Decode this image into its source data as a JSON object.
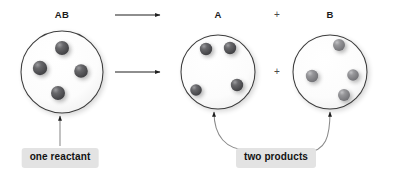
{
  "diagram": {
    "background_color": "#ffffff",
    "sphere_color_dark": "#4f4f52",
    "sphere_color_mid": "#6d6d70",
    "sphere_color_light": "#8f8f92",
    "outline_color": "#3c3c3c",
    "callout_bg_color": "#e3e3e3",
    "callout_text_color": "#121212",
    "leader_color": "#8a8a8a"
  },
  "formulas": {
    "reactant": "AB",
    "product_a": "A",
    "product_b": "B",
    "plus_top": "+",
    "plus_middle": "+"
  },
  "callouts": {
    "reactant_label": "one reactant",
    "products_label": "two products"
  },
  "containers": [
    {
      "id": "reactant-flask",
      "label": "AB",
      "cx": 62,
      "cy": 72,
      "r": 41,
      "molecule_count": 4,
      "molecules": [
        {
          "cx": 62,
          "cy": 48,
          "r": 7.0,
          "shade": "dark"
        },
        {
          "cx": 40,
          "cy": 68,
          "r": 7.2,
          "shade": "dark"
        },
        {
          "cx": 81,
          "cy": 71,
          "r": 6.8,
          "shade": "dark"
        },
        {
          "cx": 58,
          "cy": 93,
          "r": 7.0,
          "shade": "dark"
        }
      ]
    },
    {
      "id": "product-a-flask",
      "label": "A",
      "cx": 218,
      "cy": 72,
      "r": 37,
      "molecule_count": 4,
      "molecules": [
        {
          "cx": 206,
          "cy": 49,
          "r": 6.2,
          "shade": "dark"
        },
        {
          "cx": 230,
          "cy": 48,
          "r": 6.2,
          "shade": "dark"
        },
        {
          "cx": 196,
          "cy": 90,
          "r": 5.8,
          "shade": "dark"
        },
        {
          "cx": 237,
          "cy": 85,
          "r": 6.2,
          "shade": "dark"
        }
      ]
    },
    {
      "id": "product-b-flask",
      "label": "B",
      "cx": 330,
      "cy": 72,
      "r": 37,
      "molecule_count": 4,
      "molecules": [
        {
          "cx": 339,
          "cy": 45,
          "r": 6.0,
          "shade": "light"
        },
        {
          "cx": 312,
          "cy": 76,
          "r": 6.2,
          "shade": "light"
        },
        {
          "cx": 353,
          "cy": 75,
          "r": 5.8,
          "shade": "light"
        },
        {
          "cx": 344,
          "cy": 95,
          "r": 6.0,
          "shade": "light"
        }
      ]
    }
  ],
  "arrows": [
    {
      "id": "arrow-top",
      "x1": 115,
      "y1": 15,
      "x2": 163,
      "y2": 15
    },
    {
      "id": "arrow-bottom",
      "x1": 115,
      "y1": 72,
      "x2": 163,
      "y2": 72
    }
  ],
  "label_positions": {
    "reactant_formula": {
      "x": 62,
      "y": 10
    },
    "product_a_formula": {
      "x": 218,
      "y": 10
    },
    "product_b_formula": {
      "x": 330,
      "y": 10
    },
    "plus_top": {
      "x": 277,
      "y": 15
    },
    "plus_middle": {
      "x": 277,
      "y": 72
    },
    "reactant_callout": {
      "x": 60,
      "y": 148
    },
    "products_callout": {
      "x": 276,
      "y": 148
    }
  }
}
